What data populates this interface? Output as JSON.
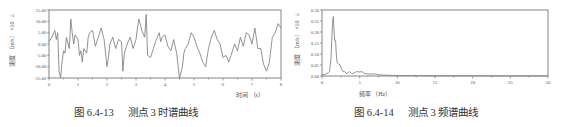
{
  "chart_data": [
    {
      "type": "line",
      "title": "",
      "caption_number": "图 6.4-13",
      "caption_text": "测点 3 时谱曲线",
      "xlabel": "时间 （s）",
      "ylabel": "速度 （m/s） ×10⁻³",
      "xlim": [
        0,
        8
      ],
      "ylim": [
        -15,
        15
      ],
      "xticks": [
        "0",
        "1",
        "2",
        "3",
        "4",
        "5",
        "6",
        "7",
        "8"
      ],
      "yticks": [
        "15.00",
        "10.00",
        "5.00",
        "0.00",
        "-5.00",
        "-10.00",
        "-15.00"
      ],
      "grid": false,
      "line_color": "#777777",
      "x": [
        0.0,
        0.1,
        0.2,
        0.25,
        0.3,
        0.35,
        0.4,
        0.45,
        0.5,
        0.55,
        0.6,
        0.7,
        0.75,
        0.8,
        0.85,
        0.9,
        1.0,
        1.05,
        1.1,
        1.15,
        1.2,
        1.3,
        1.35,
        1.4,
        1.5,
        1.6,
        1.7,
        1.8,
        1.9,
        2.0,
        2.05,
        2.1,
        2.2,
        2.3,
        2.4,
        2.5,
        2.55,
        2.6,
        2.7,
        2.8,
        2.9,
        3.0,
        3.05,
        3.1,
        3.2,
        3.3,
        3.35,
        3.4,
        3.5,
        3.6,
        3.7,
        3.8,
        3.85,
        3.9,
        4.0,
        4.1,
        4.2,
        4.3,
        4.4,
        4.5,
        4.6,
        4.65,
        4.7,
        4.8,
        4.9,
        5.0,
        5.1,
        5.2,
        5.3,
        5.4,
        5.5,
        5.6,
        5.7,
        5.8,
        5.9,
        6.0,
        6.1,
        6.2,
        6.3,
        6.4,
        6.5,
        6.6,
        6.7,
        6.8,
        6.9,
        7.0,
        7.1,
        7.2,
        7.3,
        7.4,
        7.5,
        7.6,
        7.7,
        7.8,
        7.9,
        8.0
      ],
      "values": [
        1,
        3,
        6,
        2,
        5,
        -12,
        -15,
        -8,
        -3,
        -4,
        3,
        -2,
        11,
        5,
        0,
        4,
        2,
        -5,
        -3,
        -8,
        -2,
        -4,
        3,
        5,
        6,
        -1,
        3,
        7,
        2,
        -10,
        -6,
        0,
        3,
        -2,
        2,
        1,
        -12,
        -4,
        0,
        3,
        -2,
        2,
        7,
        11,
        6,
        3,
        13,
        -5,
        -6,
        -2,
        2,
        5,
        1,
        3,
        4,
        -1,
        -3,
        2,
        -4,
        -15,
        -10,
        -4,
        -2,
        0,
        5,
        3,
        -1,
        -4,
        -8,
        -10,
        -2,
        3,
        6,
        2,
        0,
        -6,
        -5,
        -8,
        -4,
        0,
        -3,
        3,
        -1,
        5,
        4,
        0,
        7,
        -2,
        -2,
        -9,
        -12,
        -8,
        3,
        5,
        9,
        7
      ]
    },
    {
      "type": "line",
      "title": "",
      "caption_number": "图 6.4-14",
      "caption_text": "测点 3 频谱曲线",
      "xlabel": "频率 （Hz）",
      "ylabel": "速度 （m/s） ×10⁻³",
      "xlim": [
        0,
        30
      ],
      "ylim": [
        0,
        0.3
      ],
      "xticks": [
        "0",
        "5",
        "10",
        "15",
        "20",
        "25",
        "30"
      ],
      "yticks": [
        "0.30",
        "0.25",
        "0.20",
        "0.15",
        "0.10",
        "0.05",
        "0.00"
      ],
      "grid": false,
      "line_color": "#777777",
      "x": [
        0,
        0.5,
        1.0,
        1.2,
        1.4,
        1.5,
        1.6,
        1.7,
        1.8,
        1.9,
        2.0,
        2.2,
        2.4,
        2.6,
        2.8,
        3.0,
        3.3,
        3.6,
        4.0,
        4.3,
        4.6,
        5.0,
        5.3,
        5.6,
        6.0,
        6.5,
        7.0,
        7.5,
        8,
        9,
        10,
        12,
        15,
        20,
        25,
        30
      ],
      "values": [
        0.005,
        0.008,
        0.02,
        0.08,
        0.24,
        0.27,
        0.2,
        0.16,
        0.16,
        0.1,
        0.06,
        0.055,
        0.05,
        0.03,
        0.02,
        0.02,
        0.01,
        0.02,
        0.01,
        0.015,
        0.02,
        0.018,
        0.02,
        0.012,
        0.01,
        0.008,
        0.01,
        0.006,
        0.004,
        0.003,
        0.002,
        0.002,
        0.001,
        0.001,
        0.0005,
        0.0003
      ]
    }
  ],
  "figures": {
    "left": {
      "caption_number": "图 6.4-13",
      "caption_text": "测点 3 时谱曲线",
      "xlabel": "时间 （s）",
      "ylabel": "速度 （m/s） ×10",
      "ylabel_exp": "-3",
      "xticks": [
        "0",
        "1",
        "2",
        "3",
        "4",
        "5",
        "6",
        "7",
        "8"
      ],
      "yticks": [
        "15.00",
        "10.00",
        "5.00",
        "0.00",
        "-5.00",
        "-10.00",
        "-15.00"
      ]
    },
    "right": {
      "caption_number": "图 6.4-14",
      "caption_text": "测点 3 频谱曲线",
      "xlabel": "频率 （Hz）",
      "ylabel": "速度 （m/s） ×10",
      "ylabel_exp": "-3",
      "xticks": [
        "0",
        "5",
        "10",
        "15",
        "20",
        "25",
        "30"
      ],
      "yticks": [
        "0.30",
        "0.25",
        "0.20",
        "0.15",
        "0.10",
        "0.05",
        "0.00"
      ]
    }
  }
}
